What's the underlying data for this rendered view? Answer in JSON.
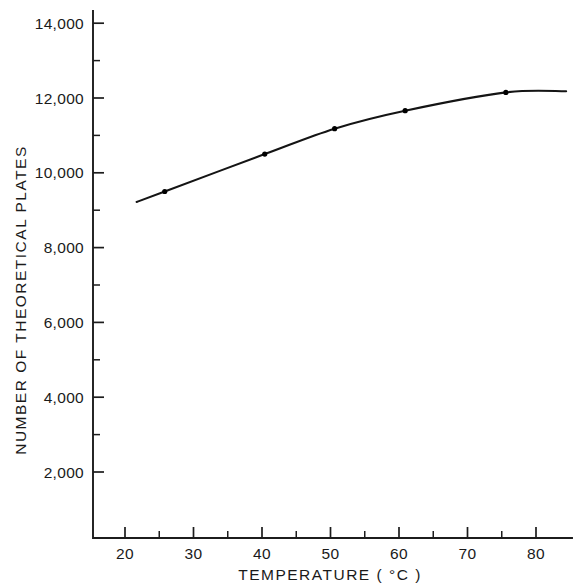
{
  "chart_data": {
    "type": "line",
    "title": "",
    "xlabel": "TEMPERATURE ( °C )",
    "ylabel": "NUMBER OF THEORETICAL PLATES",
    "xlim": [
      15,
      85
    ],
    "ylim": [
      0,
      14800
    ],
    "grid": false,
    "legend": "none",
    "x_ticks_major": [
      20,
      30,
      40,
      50,
      60,
      70,
      80
    ],
    "x_tick_labels": [
      "20",
      "30",
      "40",
      "50",
      "60",
      "70",
      "80"
    ],
    "x_ticks_minor": [
      25,
      35,
      45,
      55,
      65,
      75
    ],
    "y_ticks_major": [
      2000,
      4000,
      6000,
      8000,
      10000,
      12000,
      14000
    ],
    "y_tick_labels": [
      "2,000",
      "4,000",
      "6,000",
      "8,000",
      "10,000",
      "12,000",
      "14,000"
    ],
    "y_ticks_minor": [
      3000,
      5000,
      7000,
      9000,
      11000,
      13000
    ],
    "series": [
      {
        "name": "theoretical plates vs temperature",
        "marker": "dot",
        "x": [
          21.7,
          25.8,
          40.4,
          50.6,
          60.9,
          75.6,
          84.4
        ],
        "values": [
          9220,
          9500,
          10500,
          11180,
          11660,
          12150,
          12180
        ],
        "marker_points": [
          {
            "x": 25.8,
            "y": 9500
          },
          {
            "x": 40.4,
            "y": 10500
          },
          {
            "x": 50.6,
            "y": 11180
          },
          {
            "x": 60.9,
            "y": 11660
          },
          {
            "x": 75.6,
            "y": 12150
          }
        ]
      }
    ],
    "colors": {
      "curve": "#141414",
      "axis": "#1c1c1c",
      "background": "#ffffff",
      "text": "#1a1a1a"
    }
  }
}
